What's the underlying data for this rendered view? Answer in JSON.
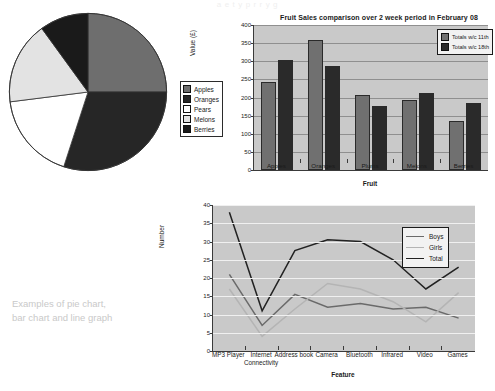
{
  "top_fragment": "a  e   t y p  r      r       y              g",
  "caption": {
    "line1": "Examples of pie chart,",
    "line2": "bar chart and line graph"
  },
  "pie": {
    "legend_title": "",
    "legend": [
      {
        "label": "Apples",
        "color": "#6e6e6e"
      },
      {
        "label": "Oranges",
        "color": "#262626"
      },
      {
        "label": "Pears",
        "color": "#ffffff"
      },
      {
        "label": "Melons",
        "color": "#e3e3e3"
      },
      {
        "label": "Berries",
        "color": "#1a1a1a"
      }
    ]
  },
  "bar": {
    "legend": [
      {
        "label": "Totals w/c 11th",
        "color": "#707070"
      },
      {
        "label": "Totals w/c 18th",
        "color": "#2a2a2a"
      }
    ]
  },
  "line": {
    "legend": [
      {
        "label": "Boys",
        "color": "#6a6a6a"
      },
      {
        "label": "Girls",
        "color": "#b4b4b4"
      },
      {
        "label": "Total",
        "color": "#222222"
      }
    ]
  },
  "chart_data": [
    {
      "type": "pie",
      "title": "",
      "labels": [
        "Apples",
        "Oranges",
        "Pears",
        "Melons",
        "Berries"
      ],
      "values": [
        25,
        30,
        18,
        17,
        10
      ],
      "colors": [
        "#6e6e6e",
        "#262626",
        "#ffffff",
        "#e3e3e3",
        "#1a1a1a"
      ],
      "legend_position": "right",
      "start_angle": 0
    },
    {
      "type": "bar",
      "title": "Fruit Sales comparison over 2 week period in February 08",
      "xlabel": "Fruit",
      "ylabel": "Value (£)",
      "categories": [
        "Apples",
        "Oranges",
        "Plums",
        "Melons",
        "Berries"
      ],
      "series": [
        {
          "name": "Totals w/c 11th",
          "color": "#707070",
          "values": [
            243,
            360,
            207,
            193,
            135
          ]
        },
        {
          "name": "Totals w/c 18th",
          "color": "#2a2a2a",
          "values": [
            303,
            288,
            177,
            213,
            185
          ]
        }
      ],
      "ylim": [
        0,
        400
      ],
      "yticks": [
        0,
        50,
        100,
        150,
        200,
        250,
        300,
        350,
        400
      ],
      "grid": true,
      "legend_position": "top-right"
    },
    {
      "type": "line",
      "title": "",
      "xlabel": "Feature",
      "ylabel": "Number",
      "categories": [
        "MP3 Player",
        "Internet Connectivity",
        "Address book",
        "Camera",
        "Bluetooth",
        "Infrared",
        "Video",
        "Games"
      ],
      "series": [
        {
          "name": "Boys",
          "color": "#6a6a6a",
          "values": [
            21,
            7,
            15.5,
            12,
            13,
            11.5,
            12,
            9
          ]
        },
        {
          "name": "Girls",
          "color": "#b4b4b4",
          "values": [
            17,
            4,
            11.5,
            18.5,
            17,
            13.5,
            8,
            16
          ]
        },
        {
          "name": "Total",
          "color": "#222222",
          "values": [
            38,
            11,
            27.5,
            30.5,
            30,
            25,
            17,
            23
          ]
        }
      ],
      "ylim": [
        0,
        40
      ],
      "yticks": [
        0,
        5,
        10,
        15,
        20,
        25,
        30,
        35,
        40
      ],
      "grid": true,
      "legend_position": "right"
    }
  ]
}
